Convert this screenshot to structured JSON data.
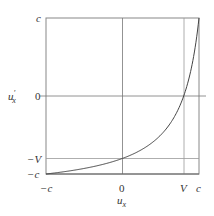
{
  "chart_data": {
    "type": "line",
    "title": "",
    "xlabel": "u_x",
    "ylabel": "u'_x",
    "x_ticks": [
      "-c",
      "0",
      "V",
      "c"
    ],
    "y_ticks": [
      "c",
      "0",
      "-V",
      "-c"
    ],
    "xlim": [
      -1,
      1
    ],
    "ylim": [
      -1,
      1
    ],
    "units": "fractions of c",
    "V": 0.8,
    "grid": true,
    "legend": null,
    "series": [
      {
        "name": "u'_x = (u_x - V) / (1 - u_x V / c^2)",
        "x": [
          -1.0,
          -0.8,
          -0.6,
          -0.4,
          -0.2,
          0.0,
          0.2,
          0.4,
          0.6,
          0.8,
          0.9,
          0.95,
          1.0
        ],
        "y": [
          -1.0,
          -0.976,
          -0.946,
          -0.897,
          -0.824,
          -0.8,
          -0.714,
          -0.588,
          -0.385,
          0.0,
          0.357,
          0.633,
          1.0
        ]
      }
    ]
  },
  "labels": {
    "y_top": "c",
    "y_zero": "0",
    "y_negV": "−V",
    "y_negc": "−c",
    "y_axis_main": "u",
    "y_axis_prime": "′",
    "y_axis_sub": "x",
    "x_negc": "−c",
    "x_zero": "0",
    "x_V": "V",
    "x_c": "c",
    "x_axis_main": "u",
    "x_axis_sub": "x"
  }
}
